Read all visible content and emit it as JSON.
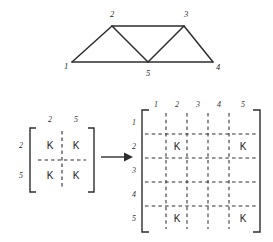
{
  "figure": {
    "ink_color": "#2e2e2e",
    "label_color": "#2b2b2b"
  },
  "truss": {
    "name": "truss-diagram",
    "nodes": [
      {
        "id": "1",
        "label": "1",
        "x": 72,
        "y": 62,
        "label_x": 66,
        "label_y": 66
      },
      {
        "id": "2",
        "label": "2",
        "x": 112,
        "y": 26,
        "label_x": 112,
        "label_y": 14
      },
      {
        "id": "3",
        "label": "3",
        "x": 184,
        "y": 26,
        "label_x": 186,
        "label_y": 14
      },
      {
        "id": "4",
        "label": "4",
        "x": 213,
        "y": 62,
        "label_x": 218,
        "label_y": 67
      },
      {
        "id": "5",
        "label": "5",
        "x": 148,
        "y": 62,
        "label_x": 148,
        "label_y": 73
      }
    ],
    "members": [
      {
        "name": "member-1-2",
        "from": "1",
        "to": "2"
      },
      {
        "name": "member-2-3",
        "from": "2",
        "to": "3"
      },
      {
        "name": "member-1-5",
        "from": "1",
        "to": "5"
      },
      {
        "name": "member-2-5",
        "from": "2",
        "to": "5"
      },
      {
        "name": "member-3-5",
        "from": "3",
        "to": "5"
      },
      {
        "name": "member-3-4",
        "from": "3",
        "to": "4"
      },
      {
        "name": "member-5-4",
        "from": "5",
        "to": "4"
      }
    ]
  },
  "element_matrix": {
    "name": "element-stiffness-matrix",
    "col_labels": [
      "2",
      "5"
    ],
    "row_labels": [
      "2",
      "5"
    ],
    "cells": [
      [
        "K",
        "K"
      ],
      [
        "K",
        "K"
      ]
    ]
  },
  "arrow": {
    "name": "transform-arrow",
    "glyph": "→"
  },
  "global_matrix": {
    "name": "global-stiffness-matrix",
    "col_labels": [
      "1",
      "2",
      "3",
      "4",
      "5"
    ],
    "row_labels": [
      "1",
      "2",
      "3",
      "4",
      "5"
    ],
    "cells": [
      [
        "",
        "",
        "",
        "",
        ""
      ],
      [
        "",
        "K",
        "",
        "",
        "K"
      ],
      [
        "",
        "",
        "",
        "",
        ""
      ],
      [
        "",
        "",
        "",
        "",
        ""
      ],
      [
        "",
        "K",
        "",
        "",
        "K"
      ]
    ]
  }
}
